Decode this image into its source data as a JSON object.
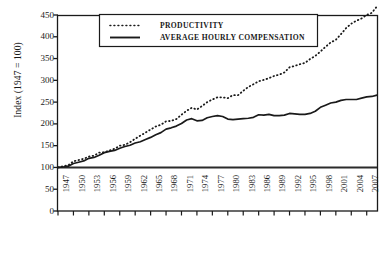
{
  "chart_data": {
    "type": "line",
    "title": "",
    "xlabel": "",
    "ylabel": "Index (1947 = 100)",
    "ylim": [
      0,
      450
    ],
    "xlim": [
      1947,
      2009
    ],
    "grid": false,
    "legend_position": "top-center",
    "yticks": [
      450,
      400,
      350,
      300,
      250,
      200,
      150,
      100,
      50,
      0
    ],
    "xticks": [
      "1947",
      "1950",
      "1953",
      "1956",
      "1959",
      "1962",
      "1965",
      "1968",
      "1971",
      "1974",
      "1977",
      "1980",
      "1983",
      "1986",
      "1989",
      "1992",
      "1995",
      "1998",
      "2001",
      "2004",
      "2007"
    ],
    "reference_line": {
      "value": 100,
      "label": ""
    },
    "x": [
      1947,
      1948,
      1949,
      1950,
      1951,
      1952,
      1953,
      1954,
      1955,
      1956,
      1957,
      1958,
      1959,
      1960,
      1961,
      1962,
      1963,
      1964,
      1965,
      1966,
      1967,
      1968,
      1969,
      1970,
      1971,
      1972,
      1973,
      1974,
      1975,
      1976,
      1977,
      1978,
      1979,
      1980,
      1981,
      1982,
      1983,
      1984,
      1985,
      1986,
      1987,
      1988,
      1989,
      1990,
      1991,
      1992,
      1993,
      1994,
      1995,
      1996,
      1997,
      1998,
      1999,
      2000,
      2001,
      2002,
      2003,
      2004,
      2005,
      2006,
      2007,
      2008,
      2009
    ],
    "series": [
      {
        "name": "PRODUCTIVITY",
        "style": "dotted",
        "color": "#1a1a1a",
        "values": [
          100,
          103,
          105,
          114,
          117,
          120,
          125,
          127,
          134,
          135,
          139,
          143,
          150,
          152,
          158,
          166,
          173,
          180,
          187,
          194,
          198,
          206,
          207,
          211,
          221,
          230,
          237,
          233,
          241,
          250,
          256,
          261,
          261,
          259,
          266,
          266,
          276,
          285,
          291,
          298,
          301,
          305,
          310,
          313,
          318,
          330,
          333,
          337,
          340,
          349,
          356,
          366,
          377,
          387,
          393,
          406,
          420,
          430,
          437,
          442,
          450,
          455,
          470
        ],
        "value_at_start": 100,
        "value_at_end": 390
      },
      {
        "name": "AVERAGE HOURLY COMPENSATION",
        "style": "solid",
        "color": "#1a1a1a",
        "values": [
          100,
          101,
          103,
          109,
          112,
          115,
          121,
          123,
          128,
          134,
          137,
          139,
          144,
          148,
          151,
          156,
          159,
          164,
          169,
          175,
          180,
          188,
          191,
          195,
          201,
          209,
          212,
          207,
          208,
          214,
          217,
          219,
          217,
          211,
          210,
          211,
          212,
          213,
          215,
          221,
          220,
          222,
          219,
          219,
          220,
          224,
          223,
          222,
          222,
          224,
          229,
          238,
          243,
          248,
          250,
          254,
          256,
          256,
          256,
          259,
          262,
          263,
          266
        ],
        "value_at_start": 100,
        "value_at_end": 212
      }
    ],
    "legend": [
      {
        "label": "PRODUCTIVITY",
        "style": "dotted"
      },
      {
        "label": "AVERAGE HOURLY COMPENSATION",
        "style": "solid"
      }
    ]
  }
}
